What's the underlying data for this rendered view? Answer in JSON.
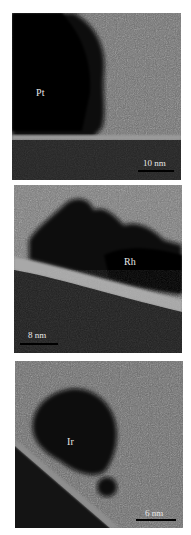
{
  "figure": {
    "panels": [
      {
        "id": "pt",
        "particle_label": "Pt",
        "scale_bar": "10 nm"
      },
      {
        "id": "rh",
        "particle_label": "Rh",
        "scale_bar": "8 nm"
      },
      {
        "id": "ir",
        "particle_label": "Ir",
        "scale_bar": "6 nm"
      }
    ]
  }
}
